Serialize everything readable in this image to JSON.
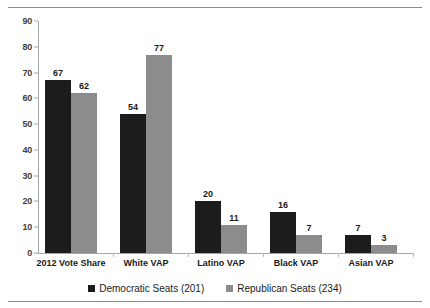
{
  "chart_data": {
    "type": "bar",
    "title": "",
    "subtitle": "",
    "xlabel": "",
    "ylabel": "",
    "categories": [
      "2012 Vote Share",
      "White VAP",
      "Latino VAP",
      "Black VAP",
      "Asian VAP"
    ],
    "series": [
      {
        "name": "Democratic Seats (201)",
        "color": "#1c1c1c",
        "values": [
          67,
          54,
          20,
          16,
          7
        ]
      },
      {
        "name": "Republican Seats (234)",
        "color": "#8c8c8c",
        "values": [
          62,
          77,
          11,
          7,
          3
        ]
      }
    ],
    "ylim": [
      0,
      90
    ],
    "yticks": [
      0,
      10,
      20,
      30,
      40,
      50,
      60,
      70,
      80,
      90
    ],
    "ytick_labels": [
      "0",
      "10",
      "20",
      "30",
      "40",
      "50",
      "60",
      "70",
      "80",
      "90"
    ],
    "grid": false,
    "legend_position": "bottom",
    "data_labels": true
  },
  "legend": {
    "items": [
      {
        "label": "Democratic Seats (201)",
        "color": "#1c1c1c",
        "marker": "square-marker"
      },
      {
        "label": "Republican Seats (234)",
        "color": "#8c8c8c",
        "marker": "square-marker"
      }
    ]
  },
  "rules": {
    "top_color": "#8a8a8a",
    "bottom_color": "#8a8a8a"
  }
}
